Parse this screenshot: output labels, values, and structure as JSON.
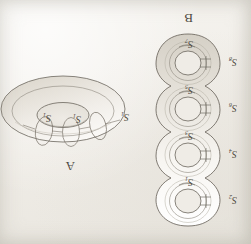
{
  "figure": {
    "caption_a": "A",
    "caption_b": "B",
    "background_color": "#f2f0ec",
    "ink_color": "#4b4740",
    "orientation": "rotated-180",
    "panels": [
      {
        "id": "A",
        "label": "A",
        "shape": "torus",
        "description": "genus-1 surface (torus) with meridian circles marked",
        "circle_labels": [
          {
            "name": "S",
            "subscript": "1",
            "position": "left-outer"
          },
          {
            "name": "S",
            "subscript": "1",
            "position": "center"
          },
          {
            "name": "S",
            "subscript": "1",
            "position": "right"
          }
        ]
      },
      {
        "id": "B",
        "label": "B",
        "shape": "genus-4-surface",
        "description": "connected sum of four tori, each handle carrying a pair of circles",
        "handles": [
          {
            "index": 1,
            "outer_label": {
              "name": "S",
              "subscript": "2"
            },
            "inner_label": {
              "name": "S",
              "subscript": "1"
            }
          },
          {
            "index": 2,
            "outer_label": {
              "name": "S",
              "subscript": "4"
            },
            "inner_label": {
              "name": "S",
              "subscript": "3"
            }
          },
          {
            "index": 3,
            "outer_label": {
              "name": "S",
              "subscript": "6"
            },
            "inner_label": {
              "name": "S",
              "subscript": "5"
            }
          },
          {
            "index": 4,
            "outer_label": {
              "name": "S",
              "subscript": "8"
            },
            "inner_label": {
              "name": "S",
              "subscript": "7"
            }
          }
        ]
      }
    ]
  }
}
